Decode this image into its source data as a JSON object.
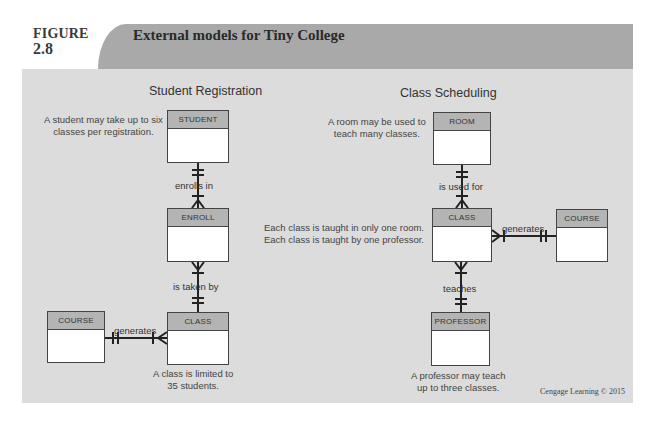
{
  "figure": {
    "label_word": "FIGURE",
    "label_number": "2.8",
    "title": "External models for Tiny College",
    "credit": "Cengage Learning © 2015"
  },
  "colors": {
    "title_bar": "#a9a9a9",
    "content_bg": "#dcdcdc",
    "entity_header": "#b4b4b4",
    "line": "#222222"
  },
  "student_registration": {
    "title": "Student Registration",
    "entities": {
      "student": "STUDENT",
      "enroll": "ENROLL",
      "class": "CLASS",
      "course": "COURSE"
    },
    "relationships": {
      "enrolls_in": "enrolls in",
      "is_taken_by": "is taken by",
      "generates": "generates"
    },
    "notes": {
      "student_line1": "A student may take up to six",
      "student_line2": "classes per registration.",
      "class_line1": "A class is limited to",
      "class_line2": "35 students."
    }
  },
  "class_scheduling": {
    "title": "Class Scheduling",
    "entities": {
      "room": "ROOM",
      "class": "CLASS",
      "course": "COURSE",
      "professor": "PROFESSOR"
    },
    "relationships": {
      "is_used_for": "is used for",
      "generates": "generates",
      "teaches": "teaches"
    },
    "notes": {
      "room_line1": "A room may be used to",
      "room_line2": "teach many classes.",
      "class_line1": "Each class is taught in only one room.",
      "class_line2": "Each class is taught by one professor.",
      "professor_line1": "A professor may teach",
      "professor_line2": "up to three classes."
    }
  }
}
